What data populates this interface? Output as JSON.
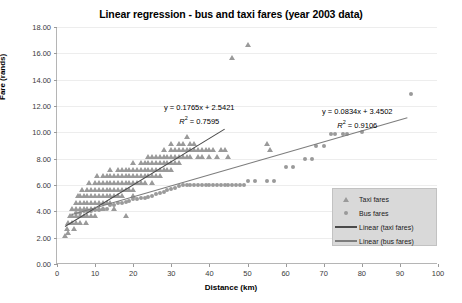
{
  "chart_data": {
    "type": "scatter",
    "title": "Linear regression - bus and taxi fares (year 2003 data)",
    "xlabel": "Distance (km)",
    "ylabel": "Fare (rands)",
    "xlim": [
      0,
      100
    ],
    "ylim": [
      0,
      18
    ],
    "xticks": [
      0,
      10,
      20,
      30,
      40,
      50,
      60,
      70,
      80,
      90,
      100
    ],
    "ytick_labels": [
      "0.00",
      "2.00",
      "4.00",
      "6.00",
      "8.00",
      "10.00",
      "12.00",
      "14.00",
      "16.00",
      "18.00"
    ],
    "yticks": [
      0,
      2,
      4,
      6,
      8,
      10,
      12,
      14,
      16,
      18
    ],
    "grid": "horizontal",
    "legend_position": "bottom-right",
    "series": [
      {
        "name": "Taxi fares",
        "marker": "triangle",
        "color": "#9a9a9a",
        "points": [
          [
            2,
            2.0
          ],
          [
            2.5,
            2.5
          ],
          [
            3,
            2.2
          ],
          [
            3,
            3.0
          ],
          [
            3.5,
            3.5
          ],
          [
            4,
            3.0
          ],
          [
            4,
            3.5
          ],
          [
            4,
            4.0
          ],
          [
            4.5,
            2.5
          ],
          [
            5,
            3.0
          ],
          [
            5,
            3.5
          ],
          [
            5,
            4.0
          ],
          [
            5,
            4.5
          ],
          [
            5.5,
            5.0
          ],
          [
            6,
            3.0
          ],
          [
            6,
            3.5
          ],
          [
            6,
            4.0
          ],
          [
            6,
            4.5
          ],
          [
            6,
            5.0
          ],
          [
            6.5,
            5.5
          ],
          [
            7,
            3.5
          ],
          [
            7,
            4.0
          ],
          [
            7,
            4.5
          ],
          [
            7,
            5.0
          ],
          [
            7.5,
            3.0
          ],
          [
            8,
            3.5
          ],
          [
            8,
            4.0
          ],
          [
            8,
            4.5
          ],
          [
            8,
            5.0
          ],
          [
            8,
            5.5
          ],
          [
            8.5,
            6.0
          ],
          [
            9,
            3.5
          ],
          [
            9,
            4.0
          ],
          [
            9,
            4.5
          ],
          [
            9,
            5.0
          ],
          [
            9,
            5.5
          ],
          [
            10,
            3.5
          ],
          [
            10,
            4.0
          ],
          [
            10,
            4.5
          ],
          [
            10,
            5.0
          ],
          [
            10,
            5.5
          ],
          [
            10,
            6.0
          ],
          [
            10.5,
            6.5
          ],
          [
            11,
            4.0
          ],
          [
            11,
            4.5
          ],
          [
            11,
            5.0
          ],
          [
            11,
            5.5
          ],
          [
            11,
            6.0
          ],
          [
            12,
            4.0
          ],
          [
            12,
            4.5
          ],
          [
            12,
            5.0
          ],
          [
            12,
            5.5
          ],
          [
            12,
            6.0
          ],
          [
            12,
            6.5
          ],
          [
            13,
            4.5
          ],
          [
            13,
            5.0
          ],
          [
            13,
            5.5
          ],
          [
            13,
            6.0
          ],
          [
            13,
            6.5
          ],
          [
            14,
            4.5
          ],
          [
            14,
            5.0
          ],
          [
            14,
            5.5
          ],
          [
            14,
            6.0
          ],
          [
            14,
            6.5
          ],
          [
            14,
            7.0
          ],
          [
            15,
            4.0
          ],
          [
            15,
            5.0
          ],
          [
            15,
            5.5
          ],
          [
            15,
            6.0
          ],
          [
            15,
            6.5
          ],
          [
            16,
            5.0
          ],
          [
            16,
            5.5
          ],
          [
            16,
            6.0
          ],
          [
            16,
            6.5
          ],
          [
            16,
            7.0
          ],
          [
            17,
            5.0
          ],
          [
            17,
            5.5
          ],
          [
            17,
            6.0
          ],
          [
            17,
            6.5
          ],
          [
            17,
            7.0
          ],
          [
            18,
            3.5
          ],
          [
            18,
            5.5
          ],
          [
            18,
            6.0
          ],
          [
            18,
            6.5
          ],
          [
            18,
            7.0
          ],
          [
            19,
            5.5
          ],
          [
            19,
            6.0
          ],
          [
            19,
            6.5
          ],
          [
            19,
            7.0
          ],
          [
            20,
            5.0
          ],
          [
            20,
            5.5
          ],
          [
            20,
            6.0
          ],
          [
            20,
            6.5
          ],
          [
            20,
            7.0
          ],
          [
            20,
            7.5
          ],
          [
            21,
            6.0
          ],
          [
            21,
            6.5
          ],
          [
            21,
            7.0
          ],
          [
            22,
            6.0
          ],
          [
            22,
            6.5
          ],
          [
            22,
            7.0
          ],
          [
            22,
            7.5
          ],
          [
            23,
            6.0
          ],
          [
            23,
            6.5
          ],
          [
            23,
            7.0
          ],
          [
            23,
            7.5
          ],
          [
            24,
            6.5
          ],
          [
            24,
            7.0
          ],
          [
            24,
            7.5
          ],
          [
            24,
            8.0
          ],
          [
            25,
            6.0
          ],
          [
            25,
            6.5
          ],
          [
            25,
            7.0
          ],
          [
            25,
            7.5
          ],
          [
            25,
            8.0
          ],
          [
            26,
            6.5
          ],
          [
            26,
            7.0
          ],
          [
            26,
            7.5
          ],
          [
            26,
            8.0
          ],
          [
            27,
            6.5
          ],
          [
            27,
            7.0
          ],
          [
            27,
            7.5
          ],
          [
            27,
            8.0
          ],
          [
            28,
            7.0
          ],
          [
            28,
            7.5
          ],
          [
            28,
            8.0
          ],
          [
            28,
            8.5
          ],
          [
            29,
            7.0
          ],
          [
            29,
            7.5
          ],
          [
            29,
            8.0
          ],
          [
            30,
            7.0
          ],
          [
            30,
            7.5
          ],
          [
            30,
            8.0
          ],
          [
            30,
            8.5
          ],
          [
            30,
            9.0
          ],
          [
            31,
            7.5
          ],
          [
            31,
            8.0
          ],
          [
            31,
            8.5
          ],
          [
            32,
            7.5
          ],
          [
            32,
            8.0
          ],
          [
            32,
            8.5
          ],
          [
            32,
            9.0
          ],
          [
            33,
            8.0
          ],
          [
            33,
            8.5
          ],
          [
            33,
            9.0
          ],
          [
            34,
            8.0
          ],
          [
            34,
            8.5
          ],
          [
            34,
            9.5
          ],
          [
            35,
            8.0
          ],
          [
            35,
            8.5
          ],
          [
            35,
            9.0
          ],
          [
            36,
            8.5
          ],
          [
            36,
            9.0
          ],
          [
            37,
            8.0
          ],
          [
            37,
            8.5
          ],
          [
            38,
            8.0
          ],
          [
            38,
            8.5
          ],
          [
            39,
            8.5
          ],
          [
            40,
            8.0
          ],
          [
            40,
            8.5
          ],
          [
            41,
            8.5
          ],
          [
            42,
            8.0
          ],
          [
            43,
            8.5
          ],
          [
            44,
            8.5
          ],
          [
            45,
            8.0
          ],
          [
            46,
            15.5
          ],
          [
            50,
            16.5
          ],
          [
            55,
            9.0
          ],
          [
            56,
            8.5
          ]
        ]
      },
      {
        "name": "Bus fares",
        "marker": "diamond",
        "color": "#9a9a9a",
        "points": [
          [
            5,
            3.9
          ],
          [
            6,
            3.9
          ],
          [
            7,
            4.0
          ],
          [
            8,
            4.0
          ],
          [
            9,
            4.0
          ],
          [
            10,
            4.1
          ],
          [
            11,
            4.1
          ],
          [
            12,
            4.2
          ],
          [
            13,
            4.2
          ],
          [
            14,
            4.5
          ],
          [
            15,
            4.5
          ],
          [
            16,
            4.6
          ],
          [
            17,
            4.6
          ],
          [
            18,
            4.7
          ],
          [
            19,
            4.8
          ],
          [
            20,
            4.9
          ],
          [
            21,
            4.9
          ],
          [
            22,
            5.0
          ],
          [
            23,
            5.0
          ],
          [
            24,
            5.1
          ],
          [
            25,
            5.2
          ],
          [
            26,
            5.3
          ],
          [
            27,
            5.4
          ],
          [
            28,
            5.5
          ],
          [
            29,
            5.6
          ],
          [
            30,
            5.7
          ],
          [
            31,
            5.8
          ],
          [
            32,
            5.9
          ],
          [
            33,
            6.0
          ],
          [
            34,
            6.0
          ],
          [
            35,
            6.0
          ],
          [
            36,
            6.0
          ],
          [
            37,
            6.0
          ],
          [
            38,
            6.0
          ],
          [
            39,
            6.0
          ],
          [
            40,
            6.0
          ],
          [
            41,
            6.0
          ],
          [
            42,
            6.0
          ],
          [
            43,
            6.0
          ],
          [
            44,
            6.0
          ],
          [
            45,
            6.0
          ],
          [
            46,
            6.0
          ],
          [
            47,
            6.0
          ],
          [
            48,
            6.0
          ],
          [
            49,
            6.0
          ],
          [
            50,
            6.3
          ],
          [
            52,
            6.3
          ],
          [
            55,
            6.3
          ],
          [
            57,
            6.3
          ],
          [
            60,
            7.4
          ],
          [
            62,
            7.4
          ],
          [
            65,
            8.0
          ],
          [
            67,
            8.0
          ],
          [
            68,
            9.0
          ],
          [
            70,
            9.0
          ],
          [
            72,
            9.9
          ],
          [
            73,
            9.9
          ],
          [
            75,
            9.9
          ],
          [
            76,
            9.9
          ],
          [
            80,
            10.0
          ],
          [
            93,
            12.9
          ]
        ]
      }
    ],
    "trendlines": [
      {
        "name": "Linear (taxi fares)",
        "slope": 0.1765,
        "intercept": 2.5421,
        "r_squared": 0.7595,
        "equation": "y = 0.1765x + 2.5421",
        "r2_text": "R",
        "r2_sup": "2",
        "r2_value": " = 0.7595",
        "color": "#4a4a4a",
        "x_start": 2,
        "x_end": 44
      },
      {
        "name": "Linear (bus fares)",
        "slope": 0.0834,
        "intercept": 3.4502,
        "r_squared": 0.9106,
        "equation": "y = 0.0834x + 3.4502",
        "r2_text": "R",
        "r2_sup": "2",
        "r2_value": " = 0.9106",
        "color": "#7d7d7d",
        "x_start": 4,
        "x_end": 92
      }
    ],
    "annotations": [
      {
        "id": "taxi-equation",
        "line1": "y = 0.1765x + 2.5421",
        "line2_prefix": "R",
        "line2_sup": "2",
        "line2_suffix": " = 0.7595"
      },
      {
        "id": "bus-equation",
        "line1": "y = 0.0834x + 3.4502",
        "line2_prefix": "R",
        "line2_sup": "2",
        "line2_suffix": " = 0.9106"
      }
    ],
    "legend": [
      {
        "label": "Taxi fares",
        "key": "triangle-marker"
      },
      {
        "label": "Bus fares",
        "key": "diamond-marker"
      },
      {
        "label": "Linear (taxi fares)",
        "key": "line-dark"
      },
      {
        "label": "Linear (bus fares)",
        "key": "line-mid"
      }
    ]
  }
}
